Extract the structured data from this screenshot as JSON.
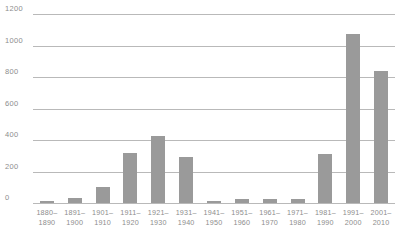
{
  "chart_data": {
    "type": "bar",
    "title": "",
    "subtitle": "",
    "xlabel": "",
    "ylabel": "",
    "ylim": [
      0,
      1200
    ],
    "yticks": [
      0,
      200,
      400,
      600,
      800,
      1000,
      1200
    ],
    "ytick_labels": [
      "0",
      "200",
      "400",
      "600",
      "800",
      "1000",
      "1200"
    ],
    "grid": true,
    "legend": "none",
    "bar_color": "#9a9a9a",
    "gridline_color": "#b9b9b9",
    "text_color": "#8d8d8d",
    "categories": [
      "1880–1890",
      "1891–1900",
      "1901–1910",
      "1911–1920",
      "1921–1930",
      "1931–1940",
      "1941–1950",
      "1951–1960",
      "1961–1970",
      "1971–1980",
      "1981–1990",
      "1991–2000",
      "2001–2010"
    ],
    "category_lines": [
      {
        "l1": "1880–",
        "l2": "1890"
      },
      {
        "l1": "1891–",
        "l2": "1900"
      },
      {
        "l1": "1901–",
        "l2": "1910"
      },
      {
        "l1": "1911–",
        "l2": "1920"
      },
      {
        "l1": "1921–",
        "l2": "1930"
      },
      {
        "l1": "1931–",
        "l2": "1940"
      },
      {
        "l1": "1941–",
        "l2": "1950"
      },
      {
        "l1": "1951–",
        "l2": "1960"
      },
      {
        "l1": "1961–",
        "l2": "1970"
      },
      {
        "l1": "1971–",
        "l2": "1980"
      },
      {
        "l1": "1981–",
        "l2": "1990"
      },
      {
        "l1": "1991–",
        "l2": "2000"
      },
      {
        "l1": "2001–",
        "l2": "2010"
      }
    ],
    "values": [
      10,
      35,
      100,
      320,
      425,
      290,
      10,
      25,
      25,
      25,
      310,
      1075,
      840
    ]
  }
}
